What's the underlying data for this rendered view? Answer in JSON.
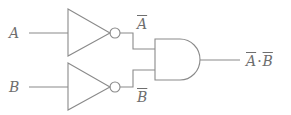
{
  "diagram": {
    "type": "logic-circuit",
    "inputs": [
      {
        "name": "A",
        "label": "A"
      },
      {
        "name": "B",
        "label": "B"
      }
    ],
    "gates": [
      {
        "id": "not1",
        "type": "NOT",
        "input": "A",
        "output_label": "A"
      },
      {
        "id": "not2",
        "type": "NOT",
        "input": "B",
        "output_label": "B"
      },
      {
        "id": "and1",
        "type": "AND",
        "inputs": [
          "not1",
          "not2"
        ]
      }
    ],
    "output": {
      "label_left": "A",
      "operator": "·",
      "label_right": "B",
      "expression": "NOT(A)·NOT(B)"
    },
    "colors": {
      "line": "#8a8a8a",
      "text": "#6e6e6e",
      "background": "#ffffff"
    }
  }
}
